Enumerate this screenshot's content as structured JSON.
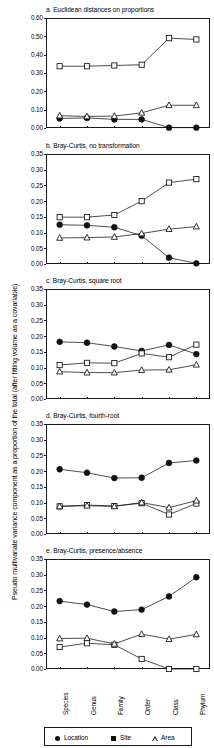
{
  "figure": {
    "ylabel": "Pseudo multivariate variance component as a proportion of the total (after fitting volume as a covariable)",
    "categories": [
      "Species",
      "Genus",
      "Family",
      "Order",
      "Class",
      "Phylum"
    ],
    "legend": [
      {
        "label": "Location",
        "marker": "filled-circle"
      },
      {
        "label": "Site",
        "marker": "filled-square"
      },
      {
        "label": "Area",
        "marker": "open-triangle"
      }
    ],
    "colors": {
      "ink": "#1a1a1a",
      "background": "#ffffff"
    }
  },
  "chart_data": [
    {
      "type": "line",
      "panel": "a",
      "title": "a. Euclidean distances on proportions",
      "categories": [
        "Species",
        "Genus",
        "Family",
        "Order",
        "Class",
        "Phylum"
      ],
      "xlabel": "",
      "ylabel": "",
      "ylim": [
        0.0,
        0.6
      ],
      "yticks": [
        "0.00",
        "0.10",
        "0.20",
        "0.30",
        "0.40",
        "0.50",
        "0.60"
      ],
      "grid": false,
      "legend_position": "bottom",
      "series": [
        {
          "name": "Location",
          "marker": "filled-circle",
          "values": [
            0.052,
            0.055,
            0.047,
            0.047,
            0.002,
            0.002
          ]
        },
        {
          "name": "Site",
          "marker": "open-square",
          "values": [
            0.337,
            0.337,
            0.341,
            0.345,
            0.49,
            0.483
          ]
        },
        {
          "name": "Area",
          "marker": "open-triangle",
          "values": [
            0.067,
            0.063,
            0.065,
            0.083,
            0.124,
            0.124
          ]
        }
      ]
    },
    {
      "type": "line",
      "panel": "b",
      "title": "b. Bray-Curtis, no transformation",
      "categories": [
        "Species",
        "Genus",
        "Family",
        "Order",
        "Class",
        "Phylum"
      ],
      "xlabel": "",
      "ylabel": "",
      "ylim": [
        0.0,
        0.35
      ],
      "yticks": [
        "0.00",
        "0.05",
        "0.10",
        "0.15",
        "0.20",
        "0.25",
        "0.30",
        "0.35"
      ],
      "grid": false,
      "legend_position": "bottom",
      "series": [
        {
          "name": "Location",
          "marker": "filled-circle",
          "values": [
            0.125,
            0.123,
            0.117,
            0.09,
            0.02,
            0.002
          ]
        },
        {
          "name": "Site",
          "marker": "open-square",
          "values": [
            0.149,
            0.149,
            0.156,
            0.2,
            0.259,
            0.27
          ]
        },
        {
          "name": "Area",
          "marker": "open-triangle",
          "values": [
            0.083,
            0.084,
            0.086,
            0.097,
            0.111,
            0.119
          ]
        }
      ]
    },
    {
      "type": "line",
      "panel": "c",
      "title": "c. Bray-Curtis, square root",
      "categories": [
        "Species",
        "Genus",
        "Family",
        "Order",
        "Class",
        "Phylum"
      ],
      "xlabel": "",
      "ylabel": "",
      "ylim": [
        0.0,
        0.35
      ],
      "yticks": [
        "0.00",
        "0.05",
        "0.10",
        "0.15",
        "0.20",
        "0.25",
        "0.30",
        "0.35"
      ],
      "grid": false,
      "legend_position": "bottom",
      "series": [
        {
          "name": "Location",
          "marker": "filled-circle",
          "values": [
            0.182,
            0.179,
            0.167,
            0.153,
            0.172,
            0.143
          ]
        },
        {
          "name": "Site",
          "marker": "open-square",
          "values": [
            0.108,
            0.115,
            0.114,
            0.145,
            0.133,
            0.173
          ]
        },
        {
          "name": "Area",
          "marker": "open-triangle",
          "values": [
            0.087,
            0.084,
            0.084,
            0.092,
            0.093,
            0.109
          ]
        }
      ]
    },
    {
      "type": "line",
      "panel": "d",
      "title": "d. Bray-Curtis, fourth-root",
      "categories": [
        "Species",
        "Genus",
        "Family",
        "Order",
        "Class",
        "Phylum"
      ],
      "xlabel": "",
      "ylabel": "",
      "ylim": [
        0.0,
        0.35
      ],
      "yticks": [
        "0.00",
        "0.05",
        "0.10",
        "0.15",
        "0.20",
        "0.25",
        "0.30",
        "0.35"
      ],
      "grid": false,
      "legend_position": "bottom",
      "series": [
        {
          "name": "Location",
          "marker": "filled-circle",
          "values": [
            0.206,
            0.195,
            0.178,
            0.179,
            0.226,
            0.234
          ]
        },
        {
          "name": "Site",
          "marker": "open-square",
          "values": [
            0.088,
            0.092,
            0.089,
            0.098,
            0.062,
            0.097
          ]
        },
        {
          "name": "Area",
          "marker": "open-triangle",
          "values": [
            0.088,
            0.09,
            0.088,
            0.1,
            0.084,
            0.106
          ]
        }
      ]
    },
    {
      "type": "line",
      "panel": "e",
      "title": "e. Bray-Curtis, presence/absence",
      "categories": [
        "Species",
        "Genus",
        "Family",
        "Order",
        "Class",
        "Phylum"
      ],
      "xlabel": "",
      "ylabel": "",
      "ylim": [
        0.0,
        0.35
      ],
      "yticks": [
        "0.00",
        "0.05",
        "0.10",
        "0.15",
        "0.20",
        "0.25",
        "0.30",
        "0.35"
      ],
      "grid": false,
      "legend_position": "bottom",
      "series": [
        {
          "name": "Location",
          "marker": "filled-circle",
          "values": [
            0.216,
            0.205,
            0.183,
            0.189,
            0.231,
            0.292
          ]
        },
        {
          "name": "Site",
          "marker": "open-square",
          "values": [
            0.07,
            0.082,
            0.077,
            0.032,
            0.0,
            0.0
          ]
        },
        {
          "name": "Area",
          "marker": "open-triangle",
          "values": [
            0.097,
            0.098,
            0.08,
            0.111,
            0.095,
            0.11
          ]
        }
      ]
    }
  ]
}
